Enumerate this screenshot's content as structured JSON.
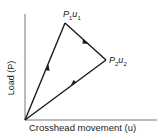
{
  "diagram": {
    "xlabel": "Crosshead movement (u)",
    "ylabel": "Load (P)",
    "points": {
      "p1": {
        "symbol": "P",
        "sub1": "1",
        "var": "u",
        "sub2": "1"
      },
      "p2": {
        "symbol": "P",
        "sub1": "2",
        "var": "u",
        "sub2": "2"
      }
    },
    "path": [
      "origin",
      "P1u1",
      "P2u2",
      "origin"
    ],
    "arrows": [
      "origin→P1 (upward)",
      "P1→P2 (downward right)",
      "P2→origin (downward left)"
    ],
    "line_color": "#1a1a1a"
  }
}
